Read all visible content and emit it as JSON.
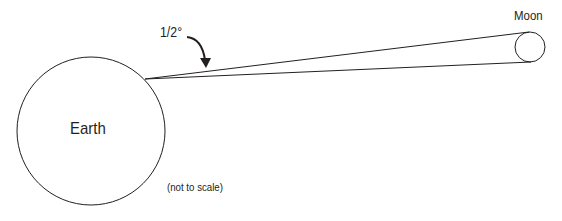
{
  "diagram": {
    "labels": {
      "earth": "Earth",
      "moon": "Moon",
      "angle": "1/2°",
      "note": "(not to scale)"
    },
    "elements": {
      "earth_circle": {
        "cx": 91,
        "cy": 131,
        "r": 74
      },
      "moon_circle": {
        "cx": 530,
        "cy": 47,
        "r": 15
      },
      "vertex": {
        "x": 145,
        "y": 79
      },
      "angle_deg": 0.5
    },
    "colors": {
      "stroke": "#231f20",
      "background": "#ffffff"
    }
  }
}
